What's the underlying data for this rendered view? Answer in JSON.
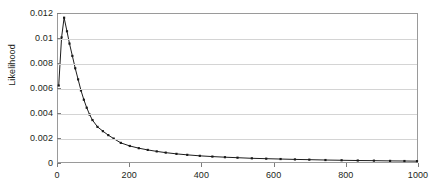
{
  "chart_data": {
    "type": "line",
    "title": "",
    "xlabel": "",
    "ylabel": "Likelihood",
    "xlim": [
      0,
      1000
    ],
    "ylim": [
      0,
      0.012
    ],
    "grid": true,
    "legend": false,
    "markers": true,
    "series_color": "#1a1a1a",
    "gridline_color": "#d4d4d4",
    "border_color": "#9a9a9a",
    "xticks": [
      0,
      200,
      400,
      600,
      800,
      1000
    ],
    "xtick_labels": [
      "0",
      "200",
      "400",
      "600",
      "800",
      "1000"
    ],
    "yticks": [
      0,
      0.002,
      0.004,
      0.006,
      0.008,
      0.01,
      0.012
    ],
    "ytick_labels": [
      "0",
      "0.002",
      "0.004",
      "0.006",
      "0.008",
      "0.01",
      "0.012"
    ],
    "series": [
      {
        "name": "likelihood",
        "x": [
          2,
          10,
          17,
          25,
          32,
          40,
          48,
          56,
          64,
          72,
          80,
          88,
          96,
          110,
          125,
          140,
          155,
          175,
          200,
          225,
          250,
          275,
          300,
          330,
          360,
          395,
          430,
          465,
          500,
          540,
          580,
          620,
          660,
          700,
          745,
          790,
          835,
          880,
          925,
          965,
          1000
        ],
        "y": [
          0.0062,
          0.0101,
          0.0117,
          0.0106,
          0.0096,
          0.0086,
          0.0076,
          0.0067,
          0.0058,
          0.00505,
          0.0044,
          0.00385,
          0.0034,
          0.00285,
          0.0025,
          0.00218,
          0.0019,
          0.00155,
          0.0013,
          0.00112,
          0.00098,
          0.00086,
          0.00076,
          0.00066,
          0.00058,
          0.0005,
          0.00044,
          0.00039,
          0.00035,
          0.0003,
          0.00027,
          0.00024,
          0.00021,
          0.00019,
          0.00016,
          0.00014,
          0.00012,
          0.00011,
          9e-05,
          8e-05,
          7e-05
        ]
      }
    ]
  }
}
